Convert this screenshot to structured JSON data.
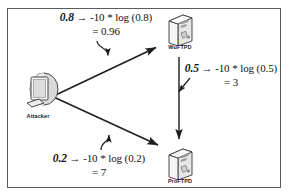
{
  "figure": {
    "type": "attack-graph-diagram",
    "frame_border_color": "#5b5b5b",
    "background_color": "#ffffff",
    "text_color": "#111111"
  },
  "nodes": [
    {
      "id": "attacker",
      "label": "Attacker",
      "icon": "desktop-computer-icon"
    },
    {
      "id": "wuftpd",
      "label": "WuFTPD",
      "icon": "server-tower-icon"
    },
    {
      "id": "proftpd",
      "label": "ProFTPD",
      "icon": "server-tower-icon"
    }
  ],
  "edges": [
    {
      "id": "attacker-to-wuftpd",
      "from": "Attacker",
      "to": "WuFTPD",
      "probability": "0.8",
      "arrow": "→",
      "expression": "-10 * log (0.8)",
      "result": "= 0.96"
    },
    {
      "id": "wuftpd-to-proftpd",
      "from": "WuFTPD",
      "to": "ProFTPD",
      "probability": "0.5",
      "arrow": "→",
      "expression": "-10 * log (0.5)",
      "result": "= 3"
    },
    {
      "id": "attacker-to-proftpd",
      "from": "Attacker",
      "to": "ProFTPD",
      "probability": "0.2",
      "arrow": "→",
      "expression": "-10 * log (0.2)",
      "result": "= 7"
    }
  ]
}
